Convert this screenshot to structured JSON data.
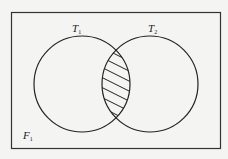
{
  "diagram": {
    "type": "venn",
    "universe": {
      "label": "F",
      "subscript": "1"
    },
    "sets": [
      {
        "label": "T",
        "subscript": "1"
      },
      {
        "label": "T",
        "subscript": "2"
      }
    ],
    "shaded_region": "intersection",
    "colors": {
      "stroke": "#222222",
      "background": "#f4f4f3"
    }
  }
}
